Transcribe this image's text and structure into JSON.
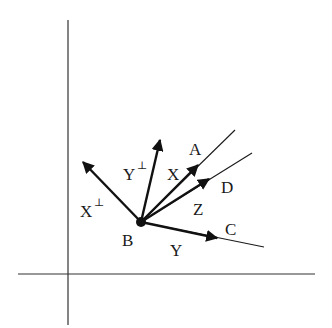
{
  "diagram": {
    "axes": {
      "vertical": {
        "x": 68,
        "y1": 20,
        "y2": 325
      },
      "horizontal": {
        "y": 274,
        "x1": 18,
        "x2": 315
      }
    },
    "origin_point": {
      "label": "B",
      "x": 141,
      "y": 222
    },
    "vectors": [
      {
        "name": "X-perp",
        "label": "X",
        "superscript": "⊥",
        "tip": [
          83,
          162
        ]
      },
      {
        "name": "Y-perp",
        "label": "Y",
        "superscript": "⊥",
        "tip": [
          160,
          140
        ]
      },
      {
        "name": "X",
        "label": "X",
        "tip": [
          198,
          165
        ]
      },
      {
        "name": "Z",
        "label": "Z",
        "tip": [
          209,
          179
        ]
      },
      {
        "name": "Y",
        "label": "Y",
        "tip": [
          217,
          238
        ]
      }
    ],
    "rays": [
      {
        "name": "ray-A",
        "label": "A",
        "end": [
          235,
          130
        ]
      },
      {
        "name": "ray-D",
        "label": "D",
        "end": [
          252,
          153
        ]
      },
      {
        "name": "ray-C",
        "label": "C",
        "end": [
          264,
          247
        ]
      }
    ],
    "labels": {
      "B": "B",
      "A": "A",
      "D": "D",
      "C": "C",
      "X": "X",
      "Z": "Z",
      "Y": "Y",
      "X_perp": "X",
      "Y_perp": "Y",
      "perp": "⊥"
    }
  }
}
